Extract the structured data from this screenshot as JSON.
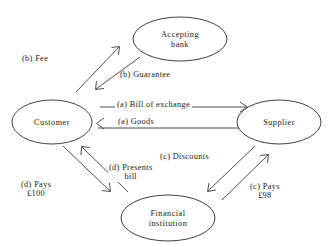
{
  "diagram": {
    "type": "flow-diagram",
    "background_color": "#ffffff",
    "line_color": "#3a3a3a",
    "text_color": "#1a1a1a",
    "nodes": [
      {
        "id": "accepting-bank",
        "label_line1": "Accepting",
        "label_line2": "bank",
        "shape": "ellipse",
        "cx": 180,
        "cy": 39,
        "rx": 47,
        "ry": 22
      },
      {
        "id": "customer",
        "label_line1": "Customer",
        "label_line2": "",
        "shape": "ellipse",
        "cx": 52,
        "cy": 122,
        "rx": 40,
        "ry": 22
      },
      {
        "id": "supplier",
        "label_line1": "Supplier",
        "label_line2": "",
        "shape": "ellipse",
        "cx": 279,
        "cy": 122,
        "rx": 42,
        "ry": 22
      },
      {
        "id": "financial-institution",
        "label_line1": "Financial",
        "label_line2": "institution",
        "shape": "ellipse",
        "cx": 168,
        "cy": 218,
        "rx": 47,
        "ry": 23
      }
    ],
    "edges": [
      {
        "id": "fee",
        "label_line1": "(b) Fee",
        "label_line2": "",
        "from": "customer",
        "to": "accepting-bank",
        "direction": "up-right"
      },
      {
        "id": "guarantee",
        "label_line1": "(b) Guarantee",
        "label_line2": "",
        "from": "accepting-bank",
        "to": "customer",
        "direction": "down-left"
      },
      {
        "id": "bill-of-exchange",
        "label_line1": "(a) Bill of exchange",
        "label_line2": "",
        "from": "customer",
        "to": "supplier",
        "direction": "right"
      },
      {
        "id": "goods",
        "label_line1": "(a) Goods",
        "label_line2": "",
        "from": "supplier",
        "to": "customer",
        "direction": "left"
      },
      {
        "id": "discounts",
        "label_line1": "(c) Discounts",
        "label_line2": "",
        "from": "supplier",
        "to": "financial-institution",
        "direction": "down-left"
      },
      {
        "id": "pays-98",
        "label_line1": "(c) Pays",
        "label_line2": "£98",
        "from": "financial-institution",
        "to": "supplier",
        "direction": "up-right"
      },
      {
        "id": "presents-bill",
        "label_line1": "(d) Presents",
        "label_line2": "bill",
        "from": "financial-institution",
        "to": "customer",
        "direction": "up-left"
      },
      {
        "id": "pays-100",
        "label_line1": "(d) Pays",
        "label_line2": "£100",
        "from": "customer",
        "to": "financial-institution",
        "direction": "down-right"
      }
    ]
  }
}
